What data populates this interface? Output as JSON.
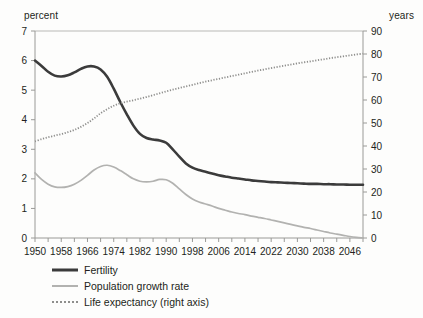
{
  "chart_data": {
    "type": "line",
    "title": "",
    "xlabel": "",
    "ylabel": "percent",
    "ylabel_right": "years",
    "xlim": [
      1950,
      2050
    ],
    "ylim": [
      0,
      7
    ],
    "ylim_right": [
      0,
      90
    ],
    "grid": false,
    "legend_position": "bottom-left",
    "x_tick_labels": [
      "1950",
      "1958",
      "1966",
      "1974",
      "1982",
      "1990",
      "1998",
      "2006",
      "2014",
      "2022",
      "2030",
      "2038",
      "2046"
    ],
    "x_tick_values": [
      1950,
      1958,
      1966,
      1974,
      1982,
      1990,
      1998,
      2006,
      2014,
      2022,
      2030,
      2038,
      2046
    ],
    "x_minor_tick_step": 4,
    "y_tick_labels_left": [
      "0",
      "1",
      "2",
      "3",
      "4",
      "5",
      "6",
      "7"
    ],
    "y_tick_values_left": [
      0,
      1,
      2,
      3,
      4,
      5,
      6,
      7
    ],
    "y_tick_labels_right": [
      "0",
      "10",
      "20",
      "30",
      "40",
      "50",
      "60",
      "70",
      "80",
      "90"
    ],
    "y_tick_values_right": [
      0,
      10,
      20,
      30,
      40,
      50,
      60,
      70,
      80,
      90
    ],
    "x": [
      1950,
      1952,
      1954,
      1956,
      1958,
      1960,
      1962,
      1964,
      1966,
      1968,
      1970,
      1972,
      1974,
      1976,
      1978,
      1980,
      1982,
      1984,
      1986,
      1988,
      1990,
      1992,
      1994,
      1996,
      1998,
      2000,
      2002,
      2004,
      2006,
      2008,
      2010,
      2012,
      2014,
      2016,
      2018,
      2020,
      2022,
      2024,
      2026,
      2028,
      2030,
      2032,
      2034,
      2036,
      2038,
      2040,
      2042,
      2044,
      2046,
      2048,
      2050
    ],
    "series": [
      {
        "name": "Fertility",
        "axis": "left",
        "color": "#3b3b3b",
        "style": "solid",
        "width": 2.6,
        "values": [
          6.0,
          5.82,
          5.62,
          5.49,
          5.46,
          5.5,
          5.6,
          5.72,
          5.8,
          5.8,
          5.7,
          5.45,
          5.05,
          4.6,
          4.18,
          3.8,
          3.52,
          3.38,
          3.33,
          3.3,
          3.22,
          3.0,
          2.75,
          2.52,
          2.38,
          2.3,
          2.24,
          2.18,
          2.12,
          2.08,
          2.04,
          2.01,
          1.98,
          1.95,
          1.93,
          1.91,
          1.89,
          1.88,
          1.87,
          1.86,
          1.85,
          1.84,
          1.83,
          1.83,
          1.82,
          1.82,
          1.81,
          1.81,
          1.8,
          1.8,
          1.8
        ]
      },
      {
        "name": "Population growth rate",
        "axis": "left",
        "color": "#b2b2b0",
        "style": "solid",
        "width": 1.7,
        "values": [
          2.2,
          1.98,
          1.82,
          1.73,
          1.71,
          1.74,
          1.82,
          1.95,
          2.12,
          2.3,
          2.42,
          2.46,
          2.4,
          2.28,
          2.14,
          2.0,
          1.92,
          1.9,
          1.92,
          1.98,
          1.97,
          1.85,
          1.66,
          1.47,
          1.32,
          1.22,
          1.15,
          1.08,
          1.0,
          0.94,
          0.88,
          0.83,
          0.79,
          0.74,
          0.7,
          0.66,
          0.61,
          0.56,
          0.51,
          0.46,
          0.41,
          0.36,
          0.32,
          0.27,
          0.22,
          0.17,
          0.13,
          0.09,
          0.05,
          0.02,
          0.0
        ]
      },
      {
        "name": "Life expectancy (right axis)",
        "axis": "right",
        "color": "#8e8e8c",
        "style": "dotted",
        "width": 1.8,
        "values": [
          42.0,
          43.0,
          43.8,
          44.5,
          45.2,
          46.0,
          47.0,
          48.3,
          50.0,
          52.0,
          54.2,
          56.0,
          57.5,
          58.6,
          59.3,
          59.9,
          60.6,
          61.3,
          62.1,
          62.9,
          63.7,
          64.5,
          65.2,
          65.9,
          66.6,
          67.3,
          68.0,
          68.6,
          69.2,
          69.8,
          70.4,
          71.0,
          71.6,
          72.2,
          72.8,
          73.3,
          73.9,
          74.4,
          74.9,
          75.4,
          75.9,
          76.4,
          76.8,
          77.3,
          77.7,
          78.2,
          78.6,
          79.0,
          79.4,
          79.8,
          80.2
        ]
      }
    ]
  },
  "legend": {
    "items": [
      {
        "label": "Fertility",
        "swatch": "solid-dark-line-icon"
      },
      {
        "label": "Population growth rate",
        "swatch": "solid-gray-line-icon"
      },
      {
        "label": "Life expectancy (right axis)",
        "swatch": "dotted-gray-line-icon"
      }
    ]
  }
}
